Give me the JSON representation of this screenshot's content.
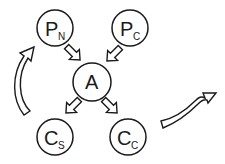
{
  "diagram": {
    "nodes": [
      {
        "id": "PN",
        "main": "P",
        "sub": "N"
      },
      {
        "id": "PC",
        "main": "P",
        "sub": "C"
      },
      {
        "id": "A",
        "main": "A",
        "sub": ""
      },
      {
        "id": "CS",
        "main": "C",
        "sub": "S"
      },
      {
        "id": "CC",
        "main": "C",
        "sub": "C"
      }
    ],
    "edges": [
      {
        "from": "PN",
        "to": "A",
        "style": "hollow-block-arrow"
      },
      {
        "from": "PC",
        "to": "A",
        "style": "hollow-block-arrow"
      },
      {
        "from": "A",
        "to": "CS",
        "style": "hollow-block-arrow"
      },
      {
        "from": "A",
        "to": "CC",
        "style": "hollow-block-arrow"
      },
      {
        "from": "CS",
        "to": "PN",
        "style": "curved-hollow-arrow"
      },
      {
        "from": "CC",
        "to": "outside",
        "style": "s-curved-hollow-arrow"
      }
    ],
    "colors": {
      "stroke": "#1a1a1a",
      "fill": "#ffffff",
      "background": "#ffffff"
    }
  }
}
